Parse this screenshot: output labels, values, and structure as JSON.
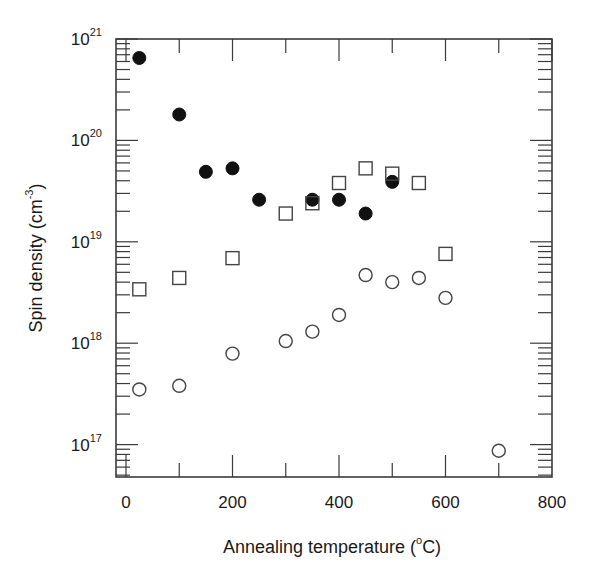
{
  "chart_data": {
    "type": "scatter",
    "title": "",
    "xlabel": "Annealing temperature (°C)",
    "ylabel": "Spin density (cm^-3)",
    "xscale": "linear",
    "yscale": "log",
    "xlim": [
      -20,
      800
    ],
    "ylim": [
      5e+16,
      1e+21
    ],
    "x_ticks": [
      0,
      200,
      400,
      600,
      800
    ],
    "x_minor_ticks": [
      100,
      300,
      500,
      700
    ],
    "y_ticks": [
      "10^17",
      "10^18",
      "10^19",
      "10^20",
      "10^21"
    ],
    "grid": false,
    "legend": null,
    "series": [
      {
        "name": "filled circles",
        "marker": "filled-circle",
        "x": [
          25,
          100,
          150,
          200,
          250,
          350,
          400,
          450,
          500
        ],
        "y": [
          6.5e+20,
          1.8e+20,
          4.9e+19,
          5.3e+19,
          2.6e+19,
          2.6e+19,
          2.6e+19,
          1.9e+19,
          3.9e+19
        ]
      },
      {
        "name": "open squares",
        "marker": "open-square",
        "x": [
          25,
          100,
          200,
          300,
          350,
          400,
          450,
          500,
          550,
          600
        ],
        "y": [
          3.4e+18,
          4.4e+18,
          6.9e+18,
          1.9e+19,
          2.4e+19,
          3.8e+19,
          5.3e+19,
          4.7e+19,
          3.8e+19,
          7.6e+18
        ]
      },
      {
        "name": "open circles",
        "marker": "open-circle",
        "x": [
          25,
          100,
          200,
          300,
          350,
          400,
          450,
          500,
          550,
          600,
          700
        ],
        "y": [
          3.5e+17,
          3.8e+17,
          7.9e+17,
          1.05e+18,
          1.3e+18,
          1.9e+18,
          4.7e+18,
          4e+18,
          4.4e+18,
          2.8e+18,
          8.7e+16
        ]
      }
    ]
  },
  "labels": {
    "x_axis": "Annealing temperature (",
    "x_axis_deg": "o",
    "x_axis_end": "C)",
    "y_axis": "Spin density (cm",
    "y_axis_exp": "-3",
    "y_axis_end": ")",
    "x_tick_labels": [
      "0",
      "200",
      "400",
      "600",
      "800"
    ],
    "y_tick_base": "10",
    "y_tick_exps": [
      "17",
      "18",
      "19",
      "20",
      "21"
    ]
  }
}
